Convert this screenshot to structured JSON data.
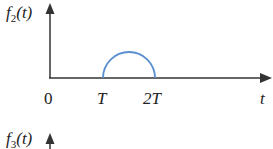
{
  "top_plot": {
    "ylabel_func": "f",
    "ylabel_sub": "2",
    "ylabel_arg": "(t)",
    "tick_labels": [
      "0",
      "T",
      "2T"
    ],
    "xlabel": "t",
    "curve": "semicircle from T to 2T",
    "curve_color": "#5b8fd0",
    "axis_color": "#333333"
  },
  "bottom_plot": {
    "ylabel_func": "f",
    "ylabel_sub": "3",
    "ylabel_arg": "(t)"
  }
}
